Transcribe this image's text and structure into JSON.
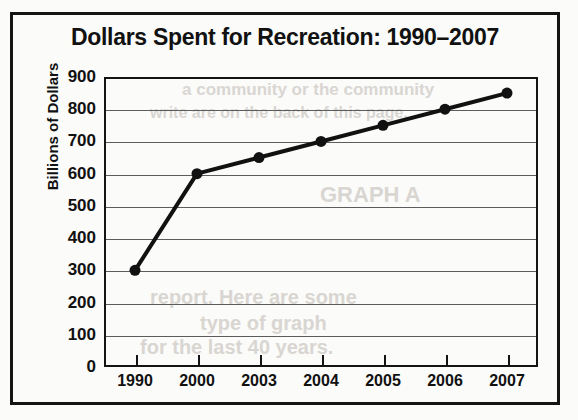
{
  "chart_data": {
    "type": "line",
    "title": "Dollars Spent for Recreation: 1990–2007",
    "xlabel": "",
    "ylabel": "Billions of Dollars",
    "categories": [
      "1990",
      "2000",
      "2003",
      "2004",
      "2005",
      "2006",
      "2007"
    ],
    "values": [
      300,
      600,
      650,
      700,
      750,
      800,
      850
    ],
    "series": [
      {
        "name": "Dollars Spent for Recreation",
        "values": [
          300,
          600,
          650,
          700,
          750,
          800,
          850
        ]
      }
    ],
    "ylim": [
      0,
      900
    ],
    "ytick_labels": [
      "900",
      "800",
      "700",
      "600",
      "500",
      "400",
      "300",
      "200",
      "100",
      "0"
    ],
    "ytick_values": [
      900,
      800,
      700,
      600,
      500,
      400,
      300,
      200,
      100,
      0
    ],
    "grid": true,
    "legend": "none",
    "marker": "filled-circle",
    "line_color": "#111111",
    "marker_color": "#111111",
    "grid_color": "#5c5c5c",
    "background_color": "#fbfbf9"
  },
  "background_bleed": [
    {
      "text": "a community or the community",
      "x": 182,
      "y": 80,
      "size": 17
    },
    {
      "text": "write are on the back of this page.",
      "x": 150,
      "y": 104,
      "size": 16
    },
    {
      "text": "GRAPH A",
      "x": 320,
      "y": 182,
      "size": 22
    },
    {
      "text": "report. Here are some",
      "x": 150,
      "y": 286,
      "size": 20
    },
    {
      "text": "type of graph",
      "x": 200,
      "y": 312,
      "size": 20
    },
    {
      "text": "for the last 40 years.",
      "x": 140,
      "y": 336,
      "size": 20
    }
  ]
}
